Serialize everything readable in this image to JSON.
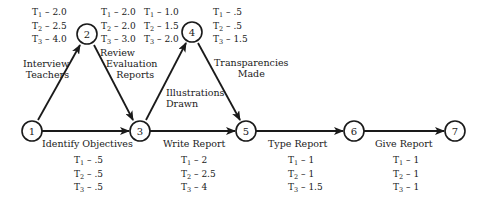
{
  "diagram": {
    "type": "PERT network",
    "nodes": [
      {
        "id": "1",
        "label": "1",
        "x": 32,
        "y": 131
      },
      {
        "id": "2",
        "label": "2",
        "x": 87,
        "y": 34
      },
      {
        "id": "3",
        "label": "3",
        "x": 140,
        "y": 131
      },
      {
        "id": "4",
        "label": "4",
        "x": 192,
        "y": 32
      },
      {
        "id": "5",
        "label": "5",
        "x": 246,
        "y": 131
      },
      {
        "id": "6",
        "label": "6",
        "x": 354,
        "y": 131
      },
      {
        "id": "7",
        "label": "7",
        "x": 455,
        "y": 131
      }
    ],
    "activities": [
      {
        "from": "1",
        "to": "2",
        "label_line1": "Interview",
        "label_line2": "Teachers",
        "times": {
          "t1": "2.0",
          "t2": "2.5",
          "t3": "4.0"
        }
      },
      {
        "from": "2",
        "to": "3",
        "label_line1": "Review",
        "label_line2": "Evaluation",
        "label_line3": "Reports",
        "times": {
          "t1": "2.0",
          "t2": "2.0",
          "t3": "3.0"
        }
      },
      {
        "from": "1",
        "to": "3",
        "label_line1": "Identify Objectives",
        "times": {
          "t1": ".5",
          "t2": ".5",
          "t3": ".5"
        }
      },
      {
        "from": "3",
        "to": "4",
        "label_line1": "Illustrations",
        "label_line2": "Drawn",
        "times": {
          "t1": "1.0",
          "t2": "1.5",
          "t3": "2.0"
        }
      },
      {
        "from": "4",
        "to": "5",
        "label_line1": "Transparencies",
        "label_line2": "Made",
        "times": {
          "t1": ".5",
          "t2": ".5",
          "t3": "1.5"
        }
      },
      {
        "from": "3",
        "to": "5",
        "label_line1": "Write Report",
        "times": {
          "t1": "2",
          "t2": "2.5",
          "t3": "4"
        }
      },
      {
        "from": "5",
        "to": "6",
        "label_line1": "Type Report",
        "times": {
          "t1": "1",
          "t2": "1",
          "t3": "1.5"
        }
      },
      {
        "from": "6",
        "to": "7",
        "label_line1": "Give Report",
        "times": {
          "t1": "1",
          "t2": "1",
          "t3": "1"
        }
      }
    ],
    "time_prefix": {
      "t1": "T",
      "t1_sub": "1",
      "t2": "T",
      "t2_sub": "2",
      "t3": "T",
      "t3_sub": "3",
      "sep": " – "
    }
  }
}
